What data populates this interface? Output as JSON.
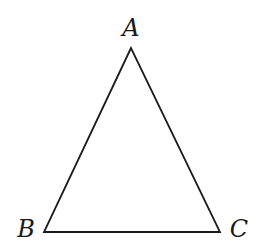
{
  "diagram": {
    "type": "triangle",
    "stroke_color": "#1a1a1a",
    "stroke_width": 1.8,
    "background": "#ffffff",
    "vertices": [
      {
        "id": "A",
        "label": "A",
        "x": 131,
        "y": 48,
        "label_x": 131,
        "label_y": 36
      },
      {
        "id": "B",
        "label": "B",
        "x": 44,
        "y": 232,
        "label_x": 26,
        "label_y": 237
      },
      {
        "id": "C",
        "label": "C",
        "x": 220,
        "y": 232,
        "label_x": 239,
        "label_y": 237
      }
    ],
    "edges": [
      {
        "from": "A",
        "to": "B"
      },
      {
        "from": "B",
        "to": "C"
      },
      {
        "from": "C",
        "to": "A"
      }
    ]
  }
}
